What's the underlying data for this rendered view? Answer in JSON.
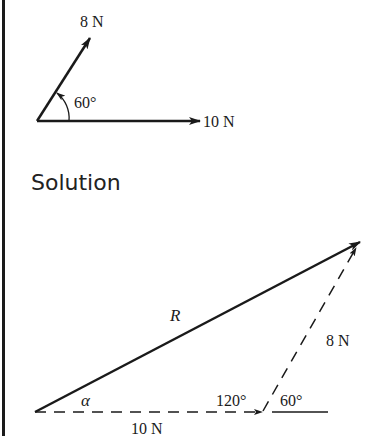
{
  "given": {
    "force_a_label": "8 N",
    "force_b_label": "10 N",
    "angle_label": "60°"
  },
  "heading": "Solution",
  "solution": {
    "resultant_label": "R",
    "alpha_label": "α",
    "side_a_label": "8 N",
    "side_b_label": "10 N",
    "interior_angle_label": "120°",
    "exterior_angle_label": "60°"
  },
  "colors": {
    "ink": "#1a1a1a",
    "background": "#ffffff"
  }
}
